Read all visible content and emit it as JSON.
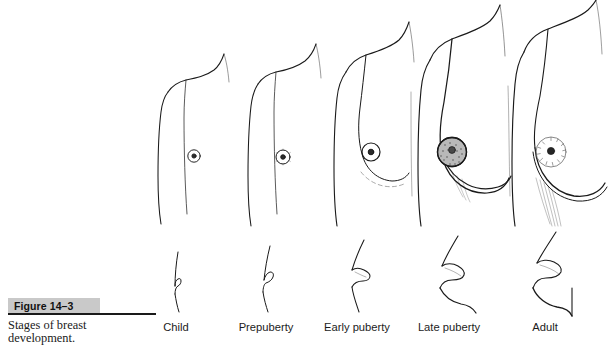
{
  "figure": {
    "number_label": "Figure 14–3",
    "caption": "Stages of breast development.",
    "background_color": "#ffffff",
    "ink_color": "#1a1a1a",
    "band_color": "#c9c9c9"
  },
  "stages": [
    {
      "id": "child",
      "label": "Child",
      "center_x": 176,
      "view_anterior": "flat chest, small point nipple",
      "view_lateral": "flat vertical profile with tiny nipple notch"
    },
    {
      "id": "prepuberty",
      "label": "Prepuberty",
      "center_x": 266,
      "view_anterior": "flat chest, slightly enlarged areola",
      "view_lateral": "nearly flat profile, small nipple"
    },
    {
      "id": "early-puberty",
      "label": "Early puberty",
      "center_x": 357,
      "view_anterior": "breast bud, raised areola ring, faint inframammary fold",
      "view_lateral": "conical bud projection"
    },
    {
      "id": "late-puberty",
      "label": "Late puberty",
      "center_x": 449,
      "view_anterior": "rounded breast, large stippled areola, defined fold",
      "view_lateral": "rounded projecting contour"
    },
    {
      "id": "adult",
      "label": "Adult",
      "center_x": 545,
      "view_anterior": "full pendulous breast, dotted areola, shaded under-fold",
      "view_lateral": "pendulous contour with deep fold"
    }
  ]
}
